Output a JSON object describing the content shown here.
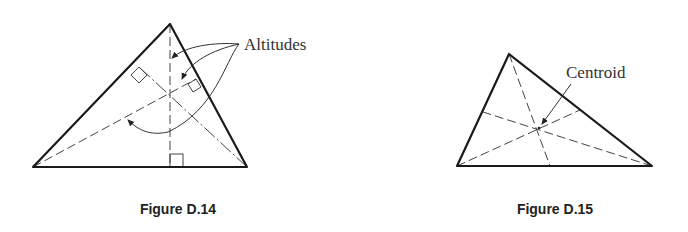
{
  "figures": [
    {
      "id": "D.14",
      "caption": "Figure D.14",
      "label": "Altitudes",
      "description": "Triangle with its three altitudes meeting at the orthocenter; right-angle markers at the feet of the altitudes",
      "vertices": [
        [
          170,
          24
        ],
        [
          33,
          167
        ],
        [
          247,
          167
        ]
      ],
      "intersection": [
        170,
        89
      ]
    },
    {
      "id": "D.15",
      "caption": "Figure D.15",
      "label": "Centroid",
      "description": "Triangle with its three medians meeting at the centroid",
      "vertices": [
        [
          509,
          54
        ],
        [
          457,
          166
        ],
        [
          652,
          166
        ]
      ],
      "intersection": [
        539,
        129
      ]
    }
  ],
  "colors": {
    "line": "#1a1a1a",
    "dashed": "#444444",
    "background": "#ffffff"
  }
}
